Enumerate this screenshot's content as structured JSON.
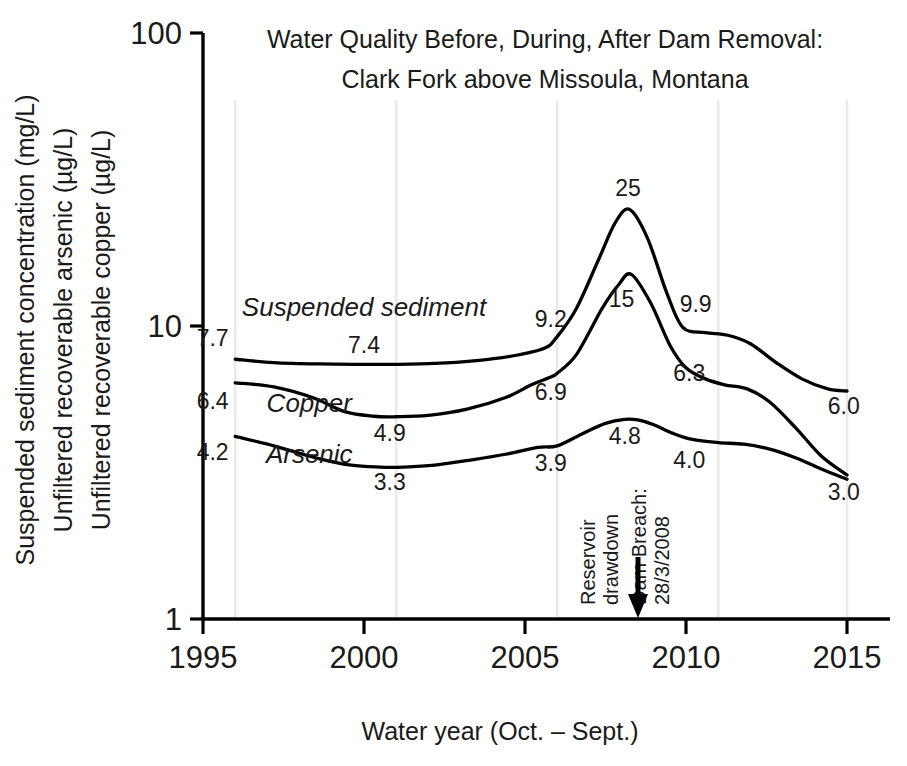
{
  "chart_data": {
    "type": "line",
    "title": "Water Quality Before, During, After Dam Removal:",
    "subtitle": "Clark Fork above Missoula, Montana",
    "xlabel": "Water year (Oct. – Sept.)",
    "ylabel_line1": "Suspended sediment concentration (mg/L)",
    "ylabel_line2": "Unfiltered recoverable arsenic (µg/L)",
    "ylabel_line3": "Unfiltered recoverable copper (µg/L)",
    "yscale": "log",
    "ylim": [
      1,
      100
    ],
    "xlim": [
      1995,
      2015
    ],
    "ytick_labels": [
      "100",
      "10",
      "1"
    ],
    "yticks": [
      100,
      10,
      1
    ],
    "xtick_labels": [
      "1995",
      "2000",
      "2005",
      "2010",
      "2015"
    ],
    "xticks": [
      1995,
      2000,
      2005,
      2010,
      2015
    ],
    "gridlines_x": [
      1996,
      2001,
      2006,
      2011,
      2015
    ],
    "grid": "vertical-only",
    "legend": "inline-series-labels",
    "series": [
      {
        "name": "Suspended sediment",
        "unit": "mg/L",
        "label_x": 2000.0,
        "label_y": 11.6,
        "x": [
          1996.0,
          1997.2,
          1998.6,
          2000.0,
          2001.0,
          2002.2,
          2003.4,
          2004.6,
          2005.6,
          2006.0,
          2006.6,
          2007.3,
          2007.8,
          2008.25,
          2008.8,
          2009.4,
          2009.9,
          2010.6,
          2011.3,
          2012.0,
          2012.8,
          2013.6,
          2014.4,
          2015.0
        ],
        "y": [
          7.7,
          7.5,
          7.42,
          7.4,
          7.4,
          7.45,
          7.6,
          7.9,
          8.4,
          9.2,
          11.5,
          17.0,
          22.5,
          25.0,
          20.0,
          13.0,
          9.9,
          9.5,
          9.3,
          8.7,
          7.5,
          6.6,
          6.1,
          6.0
        ],
        "labels": [
          {
            "text": "7.7",
            "x": 1995.3,
            "y": 9.1
          },
          {
            "text": "7.4",
            "x": 2000.0,
            "y": 8.6
          },
          {
            "text": "9.2",
            "x": 2005.8,
            "y": 10.6
          },
          {
            "text": "25",
            "x": 2008.2,
            "y": 29.6
          },
          {
            "text": "9.9",
            "x": 2010.3,
            "y": 11.9
          },
          {
            "text": "6.0",
            "x": 2014.9,
            "y": 5.35
          }
        ]
      },
      {
        "name": "Copper",
        "unit": "µg/L",
        "label_x": 1998.3,
        "label_y": 5.45,
        "x": [
          1996.0,
          1997.2,
          1998.4,
          1999.4,
          2000.3,
          2001.0,
          2002.0,
          2003.2,
          2004.4,
          2005.2,
          2005.8,
          2006.0,
          2006.6,
          2007.4,
          2007.9,
          2008.3,
          2008.9,
          2009.5,
          2010.0,
          2010.6,
          2011.2,
          2011.9,
          2012.6,
          2013.4,
          2014.2,
          2015.0
        ],
        "y": [
          6.4,
          6.2,
          5.7,
          5.1,
          4.92,
          4.9,
          4.95,
          5.2,
          5.7,
          6.3,
          6.7,
          6.9,
          8.0,
          11.5,
          13.8,
          15.0,
          12.0,
          8.6,
          7.2,
          6.6,
          6.3,
          6.1,
          5.5,
          4.5,
          3.6,
          3.1
        ],
        "labels": [
          {
            "text": "6.4",
            "x": 1995.3,
            "y": 5.55
          },
          {
            "text": "4.9",
            "x": 2000.8,
            "y": 4.3
          },
          {
            "text": "6.9",
            "x": 2005.8,
            "y": 5.95
          },
          {
            "text": "15",
            "x": 2008.0,
            "y": 12.4
          },
          {
            "text": "6.3",
            "x": 2010.1,
            "y": 6.9
          }
        ]
      },
      {
        "name": "Arsenic",
        "unit": "µg/L",
        "label_x": 1998.3,
        "label_y": 3.65,
        "x": [
          1996.0,
          1997.2,
          1998.5,
          1999.6,
          2000.5,
          2001.2,
          2002.2,
          2003.4,
          2004.4,
          2005.4,
          2006.0,
          2006.8,
          2007.5,
          2008.1,
          2008.5,
          2009.0,
          2009.6,
          2010.2,
          2011.0,
          2011.8,
          2012.6,
          2013.4,
          2014.2,
          2015.0
        ],
        "y": [
          4.2,
          3.9,
          3.55,
          3.35,
          3.3,
          3.3,
          3.35,
          3.5,
          3.65,
          3.85,
          3.9,
          4.3,
          4.65,
          4.8,
          4.78,
          4.6,
          4.3,
          4.1,
          4.0,
          3.95,
          3.8,
          3.55,
          3.25,
          3.0
        ],
        "labels": [
          {
            "text": "4.2",
            "x": 1995.3,
            "y": 3.72
          },
          {
            "text": "3.3",
            "x": 2000.8,
            "y": 2.93
          },
          {
            "text": "3.9",
            "x": 2005.8,
            "y": 3.4
          },
          {
            "text": "4.8",
            "x": 2008.1,
            "y": 4.22
          },
          {
            "text": "4.0",
            "x": 2010.1,
            "y": 3.5
          },
          {
            "text": "3.0",
            "x": 2014.9,
            "y": 2.72
          }
        ]
      }
    ],
    "annotations": [
      {
        "name": "reservoir-drawdown",
        "text_line1": "Reservoir",
        "text_line2": "drawdown",
        "x": 2007.5,
        "rotation": -90
      },
      {
        "name": "dam-breach",
        "text_line1": "Dam Breach:",
        "text_line2": "28/3/2008",
        "x": 2008.15,
        "rotation": -90,
        "marker": "down-arrow"
      }
    ],
    "colors": {
      "line": "#000000",
      "text": "#1a1a1a",
      "gridline": "#e9e9e9",
      "background": "#ffffff"
    }
  }
}
